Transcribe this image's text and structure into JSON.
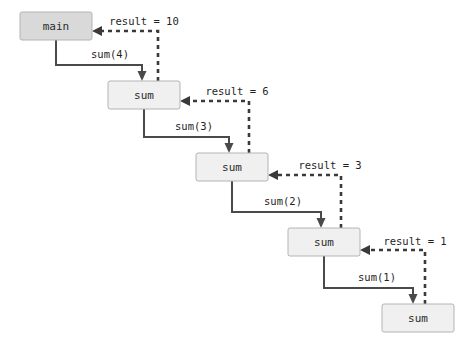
{
  "diagram": {
    "type": "call-stack-recursion",
    "colors": {
      "main_box_fill": "#d9d9d9",
      "sum_box_fill": "#f0f0f0",
      "box_border": "#b4b4b4",
      "call_arrow": "#4a4a4a",
      "return_arrow": "#3a3a3a",
      "background": "#ffffff",
      "text": "#1f1f1f"
    },
    "nodes": [
      {
        "id": "n0",
        "label": "main",
        "kind": "main",
        "x": 20,
        "y": 12,
        "w": 72,
        "h": 28
      },
      {
        "id": "n1",
        "label": "sum",
        "kind": "sum",
        "x": 108,
        "y": 81,
        "w": 72,
        "h": 28
      },
      {
        "id": "n2",
        "label": "sum",
        "kind": "sum",
        "x": 196,
        "y": 153,
        "w": 72,
        "h": 28
      },
      {
        "id": "n3",
        "label": "sum",
        "kind": "sum",
        "x": 288,
        "y": 228,
        "w": 72,
        "h": 28
      },
      {
        "id": "n4",
        "label": "sum",
        "kind": "sum",
        "x": 382,
        "y": 304,
        "w": 72,
        "h": 28
      }
    ],
    "call_edges": [
      {
        "id": "c1",
        "label": "sum(4)",
        "from": "n0",
        "to": "n1",
        "label_x": 110,
        "label_y": 58
      },
      {
        "id": "c2",
        "label": "sum(3)",
        "from": "n1",
        "to": "n2",
        "label_x": 194,
        "label_y": 130
      },
      {
        "id": "c3",
        "label": "sum(2)",
        "from": "n2",
        "to": "n3",
        "label_x": 283,
        "label_y": 205
      },
      {
        "id": "c4",
        "label": "sum(1)",
        "from": "n3",
        "to": "n4",
        "label_x": 377,
        "label_y": 281
      }
    ],
    "return_edges": [
      {
        "id": "r1",
        "label": "result = 10",
        "from": "n1",
        "to": "n0",
        "label_x": 144,
        "label_y": 25
      },
      {
        "id": "r2",
        "label": "result = 6",
        "from": "n2",
        "to": "n1",
        "label_x": 237,
        "label_y": 95
      },
      {
        "id": "r3",
        "label": "result = 3",
        "from": "n3",
        "to": "n2",
        "label_x": 330,
        "label_y": 169
      },
      {
        "id": "r4",
        "label": "result = 1",
        "from": "n4",
        "to": "n3",
        "label_x": 415,
        "label_y": 245
      }
    ]
  }
}
